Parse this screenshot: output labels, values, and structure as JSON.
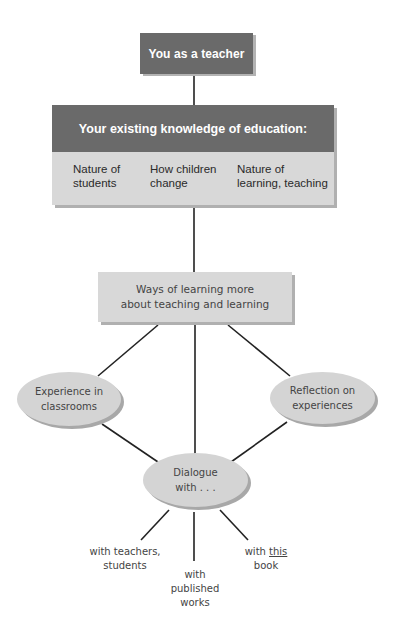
{
  "diagram": {
    "root": {
      "label": "You as a teacher"
    },
    "knowledge": {
      "title": "Your existing knowledge of education:",
      "columns": [
        {
          "line1": "Nature of",
          "line2": "students"
        },
        {
          "line1": "How children",
          "line2": "change"
        },
        {
          "line1": "Nature of",
          "line2": "learning, teaching"
        }
      ]
    },
    "ways": {
      "line1": "Ways of learning more",
      "line2": "about teaching and learning"
    },
    "branches": [
      {
        "id": "experience",
        "line1": "Experience in",
        "line2": "classrooms"
      },
      {
        "id": "reflection",
        "line1": "Reflection on",
        "line2": "experiences"
      },
      {
        "id": "dialogue",
        "line1": "Dialogue",
        "line2": "with . . ."
      }
    ],
    "dialogue_leaves": [
      {
        "line1": "with teachers,",
        "line2": "students"
      },
      {
        "line1": "with",
        "line2": "published",
        "line3": "works"
      },
      {
        "prefix": "with ",
        "emph": "this",
        "line2": "book"
      }
    ],
    "colors": {
      "dark_box": "#6a6a6a",
      "light_box": "#d8d8d8",
      "ellipse": "#d4d4d4",
      "shadow": "#b0b0b0",
      "line": "#222222"
    }
  }
}
